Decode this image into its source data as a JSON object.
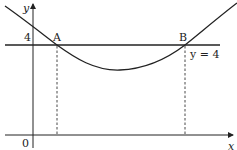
{
  "diagram": {
    "axes": {
      "x_label": "x",
      "y_label": "y",
      "origin_label": "0"
    },
    "line": {
      "label": "y = 4",
      "y_value_label": "4"
    },
    "points": [
      {
        "name": "A"
      },
      {
        "name": "B"
      }
    ],
    "colors": {
      "stroke": "#222222",
      "background": "#ffffff"
    }
  }
}
